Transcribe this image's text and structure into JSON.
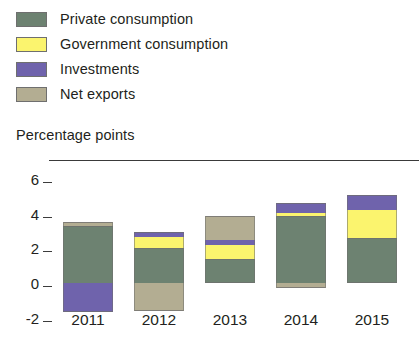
{
  "legend": {
    "items": [
      {
        "label": "Private consumption",
        "color": "#6d8271",
        "key": "private_consumption"
      },
      {
        "label": "Government consumption",
        "color": "#fbf46e",
        "key": "government_consumption"
      },
      {
        "label": "Investments",
        "color": "#6f63ac",
        "key": "investments"
      },
      {
        "label": "Net exports",
        "color": "#b3ad92",
        "key": "net_exports"
      }
    ]
  },
  "axis": {
    "y_title": "Percentage points",
    "y_ticks": [
      "6",
      "4",
      "2",
      "0",
      "-2"
    ]
  },
  "chart_data": {
    "type": "bar",
    "title": "",
    "subtitle": "",
    "xlabel": "",
    "ylabel": "Percentage points",
    "ylim": [
      -2,
      6
    ],
    "yticks": [
      -2,
      0,
      2,
      4,
      6
    ],
    "grid": false,
    "stacked": true,
    "legend_position": "top-left",
    "categories": [
      "2011",
      "2012",
      "2013",
      "2014",
      "2015"
    ],
    "series": [
      {
        "name": "Private consumption",
        "color": "#6d8271",
        "values": [
          3.3,
          2.0,
          1.4,
          3.85,
          2.6
        ]
      },
      {
        "name": "Government consumption",
        "color": "#fbf46e",
        "values": [
          0.0,
          0.65,
          0.8,
          0.2,
          1.6
        ]
      },
      {
        "name": "Investments",
        "color": "#6f63ac",
        "values": [
          -1.7,
          0.3,
          0.3,
          0.6,
          0.9
        ]
      },
      {
        "name": "Net exports",
        "color": "#b3ad92",
        "values": [
          0.25,
          -1.6,
          1.4,
          -0.3,
          0.0
        ]
      }
    ],
    "totals": [
      1.85,
      1.35,
      3.9,
      4.35,
      5.1
    ]
  },
  "bars": [
    {
      "year": "2011",
      "segments": [
        {
          "key": "private_consumption",
          "color": "#6d8271",
          "from": 0.0,
          "to": 3.3
        },
        {
          "key": "net_exports",
          "color": "#b3ad92",
          "from": 3.3,
          "to": 3.55
        },
        {
          "key": "investments",
          "color": "#6f63ac",
          "from": -1.7,
          "to": 0.0
        }
      ]
    },
    {
      "year": "2012",
      "segments": [
        {
          "key": "private_consumption",
          "color": "#6d8271",
          "from": 0.0,
          "to": 2.0
        },
        {
          "key": "government_consumption",
          "color": "#fbf46e",
          "from": 2.0,
          "to": 2.65
        },
        {
          "key": "investments",
          "color": "#6f63ac",
          "from": 2.65,
          "to": 2.95
        },
        {
          "key": "net_exports",
          "color": "#b3ad92",
          "from": -1.6,
          "to": 0.0
        }
      ]
    },
    {
      "year": "2013",
      "segments": [
        {
          "key": "private_consumption",
          "color": "#6d8271",
          "from": 0.0,
          "to": 1.4
        },
        {
          "key": "government_consumption",
          "color": "#fbf46e",
          "from": 1.4,
          "to": 2.2
        },
        {
          "key": "investments",
          "color": "#6f63ac",
          "from": 2.2,
          "to": 2.5
        },
        {
          "key": "net_exports",
          "color": "#b3ad92",
          "from": 2.5,
          "to": 3.9
        }
      ]
    },
    {
      "year": "2014",
      "segments": [
        {
          "key": "private_consumption",
          "color": "#6d8271",
          "from": 0.0,
          "to": 3.85
        },
        {
          "key": "government_consumption",
          "color": "#fbf46e",
          "from": 3.85,
          "to": 4.05
        },
        {
          "key": "investments",
          "color": "#6f63ac",
          "from": 4.05,
          "to": 4.65
        },
        {
          "key": "net_exports",
          "color": "#b3ad92",
          "from": -0.3,
          "to": 0.0
        }
      ]
    },
    {
      "year": "2015",
      "segments": [
        {
          "key": "private_consumption",
          "color": "#6d8271",
          "from": 0.0,
          "to": 2.6
        },
        {
          "key": "government_consumption",
          "color": "#fbf46e",
          "from": 2.6,
          "to": 4.2
        },
        {
          "key": "investments",
          "color": "#6f63ac",
          "from": 4.2,
          "to": 5.1
        }
      ]
    }
  ]
}
